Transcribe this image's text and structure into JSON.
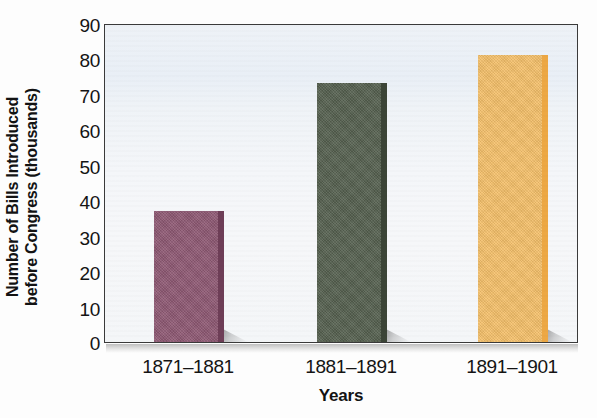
{
  "chart_data": {
    "type": "bar",
    "title": "",
    "subtitle": "",
    "categories": [
      "1871–1881",
      "1881–1891",
      "1891–1901"
    ],
    "values": [
      37,
      73,
      81
    ],
    "xlabel": "Years",
    "ylabel": "Number of Bills Introduced\nbefore Congress (thousands)",
    "ylabel_line1": "Number of Bills Introduced",
    "ylabel_line2": "before Congress (thousands)",
    "ylim": [
      0,
      90
    ],
    "ytick_step": 10,
    "ytick_labels": [
      "90",
      "80",
      "70",
      "60",
      "50",
      "40",
      "30",
      "20",
      "10",
      "0"
    ],
    "ytick_values": [
      90,
      80,
      70,
      60,
      50,
      40,
      30,
      20,
      10,
      0
    ],
    "grid": false,
    "legend": null,
    "legend_position": "none",
    "bar_colors": [
      "#8e5873",
      "#55604f",
      "#f5c06a"
    ],
    "bar_edge_colors": [
      "#6e3e57",
      "#3c4537",
      "#eda844"
    ],
    "units": "thousands of bills",
    "series": [
      {
        "name": "Number of Bills Introduced before Congress (thousands)",
        "values": [
          37,
          73,
          81
        ]
      }
    ]
  },
  "figure": {
    "plot_background_color": "#eef2f7",
    "frame_color": "#3a3a3a",
    "text_color": "#141414"
  }
}
